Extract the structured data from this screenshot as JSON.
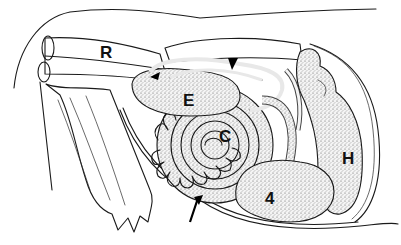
{
  "figure": {
    "labels": {
      "R": "R",
      "E": "E",
      "C": "C",
      "H": "H",
      "four": "4"
    },
    "markers": {
      "arrowhead": "arrowhead-marker",
      "arrow": "arrow-marker"
    },
    "colors": {
      "ink": "#1a1a1a",
      "paper": "#ffffff",
      "stipple": "#d9d9d9"
    }
  }
}
